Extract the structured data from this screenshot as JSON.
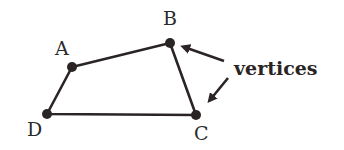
{
  "diagram": {
    "type": "quadrilateral",
    "colors": {
      "stroke": "#2a2524",
      "background": "#ffffff"
    },
    "vertices": [
      {
        "name": "A",
        "x": 72,
        "y": 67
      },
      {
        "name": "B",
        "x": 170,
        "y": 43
      },
      {
        "name": "C",
        "x": 196,
        "y": 115
      },
      {
        "name": "D",
        "x": 47,
        "y": 114
      }
    ],
    "edges": [
      [
        "A",
        "B"
      ],
      [
        "B",
        "C"
      ],
      [
        "C",
        "D"
      ],
      [
        "D",
        "A"
      ]
    ],
    "labels": {
      "A": "A",
      "B": "B",
      "C": "C",
      "D": "D"
    },
    "annotation": {
      "text": "vertices",
      "arrows_point_to": [
        "B",
        "C"
      ]
    }
  }
}
